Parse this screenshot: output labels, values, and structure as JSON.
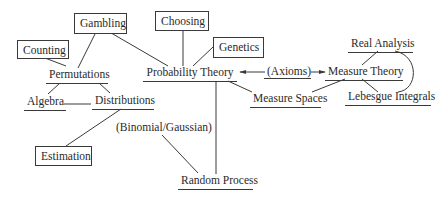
{
  "diagram": {
    "type": "concept-map",
    "nodes": {
      "gambling": "Gambling",
      "choosing": "Choosing",
      "genetics": "Genetics",
      "counting": "Counting",
      "permutations": "Permutations",
      "algebra": "Algebra",
      "distributions": "Distributions",
      "estimation": "Estimation",
      "probability_theory": "Probability Theory",
      "binomial_gaussian": "(Binomial/Gaussian)",
      "random_process": "Random Process",
      "axioms": "(Axioms)",
      "measure_theory": "Measure Theory",
      "measure_spaces": "Measure Spaces",
      "real_analysis": "Real Analysis",
      "lebesgue_integrals": "Lebesgue Integrals"
    },
    "edges": [
      [
        "Gambling",
        "Permutations"
      ],
      [
        "Gambling",
        "Probability Theory"
      ],
      [
        "Counting",
        "Permutations"
      ],
      [
        "Choosing",
        "Probability Theory"
      ],
      [
        "Genetics",
        "Probability Theory"
      ],
      [
        "Permutations",
        "Algebra"
      ],
      [
        "Permutations",
        "Distributions"
      ],
      [
        "Algebra",
        "Distributions"
      ],
      [
        "Distributions",
        "Estimation"
      ],
      [
        "Probability Theory",
        "Random Process"
      ],
      [
        "Probability Theory",
        "Measure Spaces"
      ],
      [
        "(Binomial/Gaussian)",
        "Random Process"
      ],
      [
        "(Axioms)",
        "Probability Theory"
      ],
      [
        "(Axioms)",
        "Measure Theory"
      ],
      [
        "Measure Theory",
        "Measure Spaces"
      ],
      [
        "Measure Theory",
        "Real Analysis"
      ],
      [
        "Measure Theory",
        "Lebesgue Integrals"
      ],
      [
        "Real Analysis",
        "Lebesgue Integrals"
      ]
    ]
  }
}
